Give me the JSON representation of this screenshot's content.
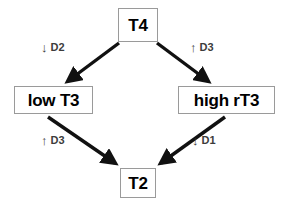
{
  "diagram": {
    "background_color": "#ffffff",
    "node_border_color": "#9a9a9a",
    "edge_color": "#111111",
    "label_color": "#3c3c3c",
    "nodes": [
      {
        "id": "t4",
        "label": "T4"
      },
      {
        "id": "low_t3",
        "label": "low T3"
      },
      {
        "id": "high_rt3",
        "label": "high rT3"
      },
      {
        "id": "t2",
        "label": "T2"
      }
    ],
    "edges": [
      {
        "id": "t4-to-low-t3",
        "from": "t4",
        "to": "low_t3",
        "label_arrow": "down-arrow-icon",
        "label_arrow_glyph": "↓",
        "label_text": "D2"
      },
      {
        "id": "t4-to-high-rt3",
        "from": "t4",
        "to": "high_rt3",
        "label_arrow": "up-arrow-icon",
        "label_arrow_glyph": "↑",
        "label_text": "D3"
      },
      {
        "id": "low-t3-to-t2",
        "from": "low_t3",
        "to": "t2",
        "label_arrow": "up-arrow-icon",
        "label_arrow_glyph": "↑",
        "label_text": "D3"
      },
      {
        "id": "high-rt3-to-t2",
        "from": "high_rt3",
        "to": "t2",
        "label_arrow": "down-arrow-icon",
        "label_arrow_glyph": "↓",
        "label_text": "D1"
      }
    ]
  }
}
